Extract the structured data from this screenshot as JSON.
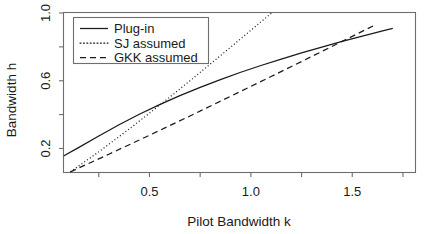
{
  "chart_data": {
    "type": "line",
    "title": "",
    "xlabel": "Pilot Bandwidth k",
    "ylabel": "Bandwidth h",
    "xlim": [
      0.076,
      1.812
    ],
    "ylim": [
      0.058,
      1.003
    ],
    "grid": false,
    "legend_position": "top-left",
    "xticks": [
      0.5,
      1.0,
      1.5
    ],
    "xtick_labels": [
      "0.5",
      "1.0",
      "1.5"
    ],
    "xticks_minor": [
      0.25,
      0.75,
      1.25,
      1.75
    ],
    "yticks": [
      0.2,
      0.6,
      1.0
    ],
    "ytick_labels": [
      "0.2",
      "0.6",
      "1.0"
    ],
    "yticks_minor": [
      0.4,
      0.8
    ],
    "series": [
      {
        "name": "Plug-in",
        "style": "solid",
        "x": [
          0.076,
          0.15,
          0.25,
          0.35,
          0.45,
          0.55,
          0.65,
          0.75,
          0.85,
          0.95,
          1.05,
          1.15,
          1.25,
          1.35,
          1.45,
          1.55,
          1.65,
          1.7
        ],
        "y": [
          0.155,
          0.205,
          0.274,
          0.34,
          0.402,
          0.459,
          0.512,
          0.561,
          0.607,
          0.65,
          0.69,
          0.728,
          0.764,
          0.799,
          0.832,
          0.864,
          0.894,
          0.909
        ]
      },
      {
        "name": "SJ assumed",
        "style": "dotted",
        "x": [
          0.11,
          0.25,
          0.4,
          0.55,
          0.7,
          0.85,
          1.0,
          1.1,
          1.18
        ],
        "y": [
          0.062,
          0.18,
          0.315,
          0.455,
          0.6,
          0.748,
          0.898,
          0.998,
          1.078
        ]
      },
      {
        "name": "GKK assumed",
        "style": "dashed",
        "x": [
          0.11,
          0.3,
          0.5,
          0.7,
          0.9,
          1.1,
          1.3,
          1.5,
          1.62
        ],
        "y": [
          0.062,
          0.166,
          0.278,
          0.392,
          0.508,
          0.625,
          0.743,
          0.862,
          0.934
        ]
      }
    ]
  },
  "legend": {
    "entries": [
      {
        "label": "Plug-in",
        "style": "solid"
      },
      {
        "label": "SJ assumed",
        "style": "dotted"
      },
      {
        "label": "GKK assumed",
        "style": "dashed"
      }
    ]
  },
  "colors": {
    "background": "#ffffff",
    "ink": "#1a1a1a",
    "axis": "#6e6e6e"
  }
}
